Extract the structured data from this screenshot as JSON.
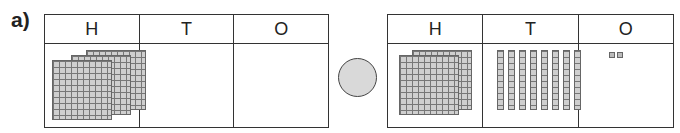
{
  "question_label": "a)",
  "left_chart": {
    "headers": [
      "H",
      "T",
      "O"
    ],
    "hundreds": 3,
    "tens": 0,
    "ones": 0
  },
  "comparison": {
    "symbol": "",
    "fill": "#d9d9d9"
  },
  "right_chart": {
    "headers": [
      "H",
      "T",
      "O"
    ],
    "hundreds": 2,
    "tens": 8,
    "ones": 2
  }
}
